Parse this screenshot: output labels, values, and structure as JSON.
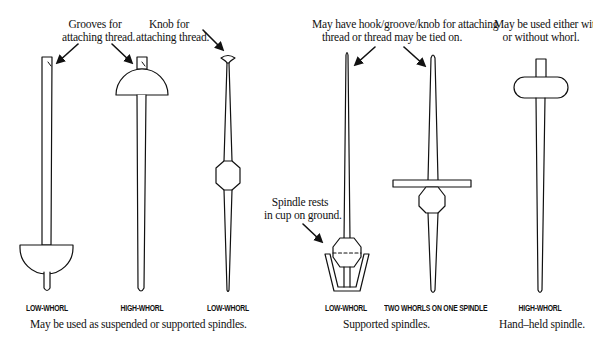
{
  "annotations": {
    "grooves": "Grooves for\nattaching thread.",
    "grooves_line1": "Grooves for",
    "grooves_line2": "attaching thread.",
    "knob_line1": "Knob for",
    "knob_line2": "attaching thread.",
    "hook_line1": "May have hook/groove/knob for attaching",
    "hook_line2": "thread or thread may be tied on.",
    "whorl_line1": "May be used either with",
    "whorl_line2": "or without whorl.",
    "cup_line1": "Spindle rests",
    "cup_line2": "in cup on ground."
  },
  "spindles": [
    {
      "label": "LOW-WHORL",
      "whorl": "hemisphere-bottom",
      "top": "grooves"
    },
    {
      "label": "HIGH-WHORL",
      "whorl": "dome-top",
      "top": "grooves"
    },
    {
      "label": "LOW-WHORL",
      "whorl": "ball-middle",
      "top": "knob"
    },
    {
      "label": "LOW-WHORL",
      "whorl": "ball-in-cup",
      "top": "plain"
    },
    {
      "label": "TWO WHORLS ON ONE SPINDLE",
      "whorl": "bar-and-ball",
      "top": "plain"
    },
    {
      "label": "HIGH-WHORL",
      "whorl": "capsule-top",
      "top": "peg"
    }
  ],
  "captions": {
    "group1": "May be used as suspended or supported spindles.",
    "group2": "Supported spindles.",
    "group3": "Hand–held spindle."
  },
  "colors": {
    "ink": "#111111",
    "background": "#ffffff"
  }
}
